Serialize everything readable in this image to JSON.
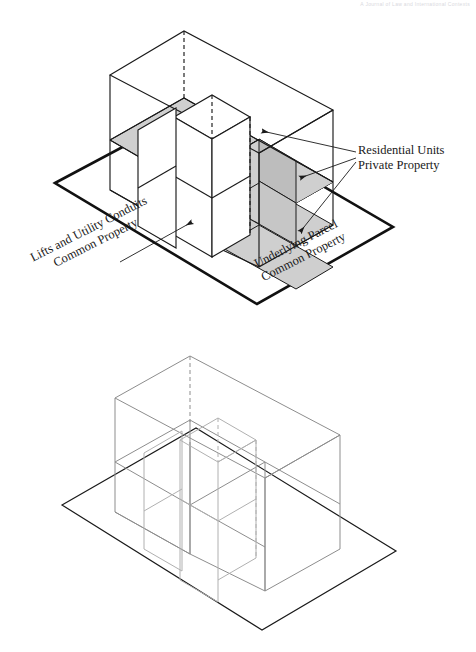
{
  "page": {
    "header_text": "A Journal of Law and International Contexts",
    "background": "#ffffff",
    "width": 476,
    "height": 652
  },
  "colors": {
    "outline_dark": "#1a1a1a",
    "parcel_edge_top": "#111111",
    "wireframe_light": "#8d8d8d",
    "slab_fill": "#cfcfcf",
    "slab_fill_dark": "#bdbdbd",
    "core_fill": "#ffffff",
    "leader_line": "#1a1a1a"
  },
  "figures": [
    {
      "id": "figure-top",
      "name": "shaded-strata-diagram",
      "caption": "Isometric cutaway of a multi-storey strata building showing shaded residential floor slabs, a central lift and utility core, and the underlying land parcel plane.",
      "shaded": true,
      "labels": [
        {
          "id": "label-residential",
          "lines": [
            "Residential  Units",
            "Private Property"
          ],
          "anchor": "right",
          "rotation_deg": 0,
          "arrow_count": 3,
          "arrow_direction": "left"
        },
        {
          "id": "label-lifts",
          "lines": [
            "Lifts and Utility Conduits",
            "Common Property"
          ],
          "anchor": "bottom-left",
          "rotation_deg": -27,
          "arrow_count": 1,
          "arrow_direction": "up-right"
        },
        {
          "id": "label-parcel",
          "lines": [
            "Underlying Parcel",
            "Common Property"
          ],
          "anchor": "bottom-center",
          "rotation_deg": -27,
          "arrow_count": 0,
          "arrow_direction": "none"
        }
      ]
    },
    {
      "id": "figure-bottom",
      "name": "wireframe-strata-diagram",
      "caption": "The same isometric building volume drawn as an unshaded light-grey wireframe with the underlying parcel plane, without annotation labels.",
      "shaded": false,
      "labels": []
    }
  ],
  "geometry": {
    "projection": "isometric",
    "storeys": 2,
    "core_description": "central vertical lift and utility shaft",
    "parcel_description": "flat quadrilateral land plane beneath the building"
  }
}
